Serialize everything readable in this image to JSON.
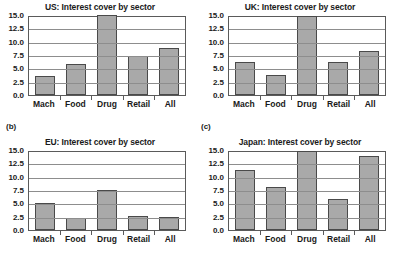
{
  "figure": {
    "panel_tags": [
      {
        "name": "tag-b",
        "label": "(b)"
      },
      {
        "name": "tag-c",
        "label": "(c)"
      }
    ]
  },
  "chart_data": [
    {
      "type": "bar",
      "title": "US: Interest cover by sector",
      "categories": [
        "Mach",
        "Food",
        "Drug",
        "Retail",
        "All"
      ],
      "values": [
        3.6,
        5.9,
        15.0,
        7.4,
        8.8
      ],
      "xlabel": "",
      "ylabel": "",
      "ylim": [
        0.0,
        15.0
      ],
      "yticks": [
        "0.0",
        "2.5",
        "5.0",
        "7.5",
        "10.0",
        "12.5",
        "15.0"
      ],
      "grid": true,
      "legend": "none",
      "bar_color": "#a9a9a9",
      "bar_edge_color": "#4a4a4a"
    },
    {
      "type": "bar",
      "title": "UK: Interest cover by sector",
      "categories": [
        "Mach",
        "Food",
        "Drug",
        "Retail",
        "All"
      ],
      "values": [
        6.2,
        3.8,
        14.9,
        6.1,
        8.2
      ],
      "xlabel": "",
      "ylabel": "",
      "ylim": [
        0.0,
        15.0
      ],
      "yticks": [
        "0.0",
        "2.5",
        "5.0",
        "7.5",
        "10.0",
        "12.5",
        "15.0"
      ],
      "grid": true,
      "legend": "none",
      "bar_color": "#a9a9a9",
      "bar_edge_color": "#4a4a4a"
    },
    {
      "type": "bar",
      "title": "EU: Interest cover by sector",
      "categories": [
        "Mach",
        "Food",
        "Drug",
        "Retail",
        "All"
      ],
      "values": [
        5.1,
        2.3,
        7.5,
        2.7,
        2.4
      ],
      "xlabel": "",
      "ylabel": "",
      "ylim": [
        0.0,
        15.0
      ],
      "yticks": [
        "0.0",
        "2.5",
        "5.0",
        "7.5",
        "10.0",
        "12.5",
        "15.0"
      ],
      "grid": true,
      "legend": "none",
      "bar_color": "#a9a9a9",
      "bar_edge_color": "#4a4a4a"
    },
    {
      "type": "bar",
      "title": "Japan: Interest cover by sector",
      "categories": [
        "Mach",
        "Food",
        "Drug",
        "Retail",
        "All"
      ],
      "values": [
        11.3,
        8.0,
        14.9,
        5.9,
        13.9
      ],
      "xlabel": "",
      "ylabel": "",
      "ylim": [
        0.0,
        15.0
      ],
      "yticks": [
        "0.0",
        "2.5",
        "5.0",
        "7.5",
        "10.0",
        "12.5",
        "15.0"
      ],
      "grid": true,
      "legend": "none",
      "bar_color": "#a9a9a9",
      "bar_edge_color": "#4a4a4a"
    }
  ]
}
